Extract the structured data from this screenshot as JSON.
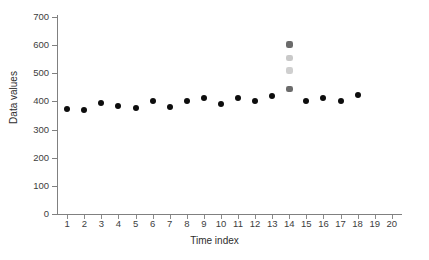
{
  "chart_data": {
    "type": "scatter",
    "title": "",
    "xlabel": "Time index",
    "ylabel": "Data values",
    "xlim": [
      0.4,
      20.6
    ],
    "ylim": [
      0,
      700
    ],
    "grid": false,
    "legend": "none",
    "y_ticks": [
      0,
      100,
      200,
      300,
      400,
      500,
      600,
      700
    ],
    "y_tick_labels": [
      "0",
      "100",
      "200",
      "300",
      "400",
      "500",
      "600",
      "700"
    ],
    "x_ticks": [
      1,
      2,
      3,
      4,
      5,
      6,
      7,
      8,
      9,
      10,
      11,
      12,
      13,
      14,
      15,
      16,
      17,
      18,
      19,
      20
    ],
    "x_tick_labels": [
      "1",
      "2",
      "3",
      "4",
      "5",
      "6",
      "7",
      "8",
      "9",
      "10",
      "11",
      "12",
      "13",
      "14",
      "15",
      "16",
      "17",
      "18",
      "19",
      "20"
    ],
    "series": [
      {
        "name": "Data values",
        "marker": "circle",
        "color": "#0d0d0d",
        "x": [
          1,
          2,
          3,
          4,
          5,
          6,
          7,
          8,
          9,
          10,
          11,
          12,
          13,
          15,
          16,
          17,
          18
        ],
        "values": [
          374,
          369,
          395,
          384,
          377,
          403,
          381,
          401,
          413,
          390,
          412,
          402,
          418,
          403,
          412,
          403,
          424
        ]
      },
      {
        "name": "Index 14 cluster",
        "marker": "diamond",
        "x": [
          14,
          14,
          14,
          14
        ],
        "values": [
          603,
          555,
          510,
          445
        ],
        "colors": [
          "#6b6b6b",
          "#c9c9c9",
          "#cfcfcf",
          "#6b6b6b"
        ]
      }
    ]
  },
  "axes": {
    "x_title": "Time index",
    "y_title": "Data values"
  }
}
